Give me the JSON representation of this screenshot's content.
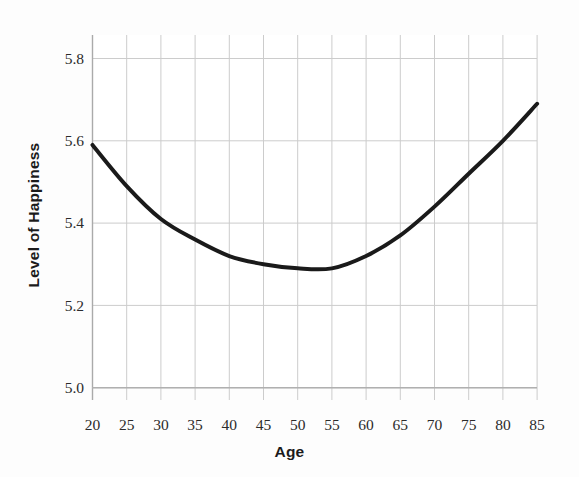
{
  "chart_data": {
    "type": "line",
    "title": "",
    "xlabel": "Age",
    "ylabel": "Level of Happiness",
    "xlim": [
      20,
      85
    ],
    "ylim": [
      5.0,
      5.8
    ],
    "xticks": [
      20,
      25,
      30,
      35,
      40,
      45,
      50,
      55,
      60,
      65,
      70,
      75,
      80,
      85
    ],
    "xtick_labels": [
      "20",
      "25",
      "30",
      "35",
      "40",
      "45",
      "50",
      "55",
      "60",
      "65",
      "70",
      "75",
      "80",
      "85"
    ],
    "yticks": [
      5.0,
      5.2,
      5.4,
      5.6,
      5.8
    ],
    "ytick_labels": [
      "5.0",
      "5.2",
      "5.4",
      "5.6",
      "5.8"
    ],
    "grid": true,
    "grid_color": "#c9c9c9",
    "legend": null,
    "line_color": "#1a1a1a",
    "line_width": 4,
    "series": [
      {
        "name": "Level of Happiness by Age",
        "x": [
          20,
          25,
          30,
          35,
          40,
          45,
          50,
          55,
          60,
          65,
          70,
          75,
          80,
          85
        ],
        "values": [
          5.59,
          5.49,
          5.41,
          5.36,
          5.32,
          5.3,
          5.29,
          5.29,
          5.32,
          5.37,
          5.44,
          5.52,
          5.6,
          5.69
        ]
      }
    ],
    "annotations": {
      "minimum_age": 52,
      "minimum_value": 5.29,
      "start_value": 5.59,
      "end_value": 5.69
    }
  },
  "axes": {
    "x_axis_label": "Age",
    "y_axis_label": "Level of Happiness"
  }
}
